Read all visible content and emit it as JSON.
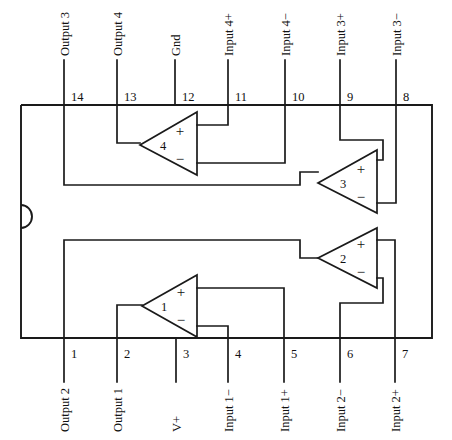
{
  "figure": {
    "type": "schematic-diagram",
    "package": {
      "pin_count": 14,
      "notch": "semicircular-left-edge"
    }
  },
  "amplifiers": [
    {
      "id": "amp1",
      "number": "1",
      "plus": "+",
      "minus": "−"
    },
    {
      "id": "amp2",
      "number": "2",
      "plus": "+",
      "minus": "−"
    },
    {
      "id": "amp3",
      "number": "3",
      "plus": "+",
      "minus": "−"
    },
    {
      "id": "amp4",
      "number": "4",
      "plus": "+",
      "minus": "−"
    }
  ],
  "top_pins": [
    {
      "number": "14",
      "label": "Output 3",
      "x": 64
    },
    {
      "number": "13",
      "label": "Output 4",
      "x": 117
    },
    {
      "number": "12",
      "label": "Gnd",
      "x": 175
    },
    {
      "number": "11",
      "label": "Input 4+",
      "x": 228
    },
    {
      "number": "10",
      "label": "Input 4−",
      "x": 285
    },
    {
      "number": "9",
      "label": "Input 3+",
      "x": 340
    },
    {
      "number": "8",
      "label": "Input 3−",
      "x": 396
    }
  ],
  "bottom_pins": [
    {
      "number": "1",
      "label": "Output 2",
      "x": 64
    },
    {
      "number": "2",
      "label": "Output 1",
      "x": 117
    },
    {
      "number": "3",
      "label": "V+",
      "x": 176
    },
    {
      "number": "4",
      "label": "Input 1−",
      "x": 228
    },
    {
      "number": "5",
      "label": "Input 1+",
      "x": 284
    },
    {
      "number": "6",
      "label": "Input 2−",
      "x": 340
    },
    {
      "number": "7",
      "label": "Input 2+",
      "x": 395
    }
  ],
  "colors": {
    "ink": "#1a1a1a",
    "paper": "#ffffff"
  }
}
